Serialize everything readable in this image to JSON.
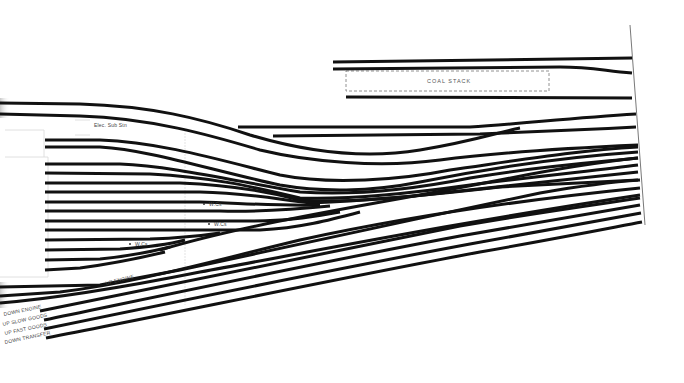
{
  "diagram": {
    "colors": {
      "track": "#111111",
      "label": "#444444",
      "background": "#ffffff"
    },
    "labels": {
      "coal_stack": "COAL STACK",
      "elec_sub_stn": "Elec. Sub Stn",
      "wc_1": "W.Cs",
      "wc_2": "W.Cs",
      "wc_3": "W.Cs",
      "up_engine": "UP ENGINE",
      "down_engine": "DOWN ENGINE",
      "up_slow_goods": "UP SLOW GOODS",
      "up_fast_goods": "UP FAST GOODS",
      "down_transfer": "DOWN TRANSFER"
    },
    "tracks": [
      {
        "id": "coal-top",
        "d": "M333,62 L632,58"
      },
      {
        "id": "coal-mid",
        "d": "M333,69 L560,67 C590,67 600,70 632,73"
      },
      {
        "id": "coal-bottom",
        "d": "M346,97 L632,98"
      },
      {
        "id": "upper-long",
        "d": "M238,127 L470,127 C520,124 570,118 636,114"
      },
      {
        "id": "upper-short",
        "d": "M273,136 L480,134 C520,132 580,130 636,127"
      },
      {
        "id": "main-1",
        "d": "M0,103 L80,104 C150,106 200,118 250,135 C300,150 360,160 420,150 C470,142 500,132 520,128"
      },
      {
        "id": "main-2",
        "d": "M0,114 L80,116 C150,118 210,135 260,150 C310,162 380,168 440,160 C500,152 570,148 638,145"
      },
      {
        "id": "siding-1",
        "d": "M45,140 L100,140 C160,142 220,160 280,175 C330,185 400,180 450,170 C520,160 580,150 638,147"
      },
      {
        "id": "siding-2",
        "d": "M45,147 L100,147 C150,150 210,170 280,185 C320,192 370,192 420,182 C500,166 580,156 638,152"
      },
      {
        "id": "siding-3",
        "d": "M45,164 L120,164 C170,166 230,180 300,192 C360,196 420,188 470,178 C540,166 600,162 638,158"
      },
      {
        "id": "siding-4",
        "d": "M45,173 L150,174 C210,177 250,186 300,198 C350,200 420,192 470,185 C540,176 600,170 638,165"
      },
      {
        "id": "siding-5",
        "d": "M45,183 L180,183 C230,185 270,192 300,200 C340,203 400,198 450,192 C530,183 590,177 638,172"
      },
      {
        "id": "siding-6",
        "d": "M45,192 L200,192 C250,193 280,200 310,203 C380,200 440,194 500,187 C560,184 600,182 638,180"
      },
      {
        "id": "siding-7",
        "d": "M45,202 L200,202 C240,203 270,206 320,205"
      },
      {
        "id": "siding-8",
        "d": "M45,211 L220,211 C260,212 290,210 330,206"
      },
      {
        "id": "siding-9",
        "d": "M45,221 L250,221 C290,221 310,217 340,212"
      },
      {
        "id": "siding-10",
        "d": "M45,230 L260,230 C300,228 330,220 360,212"
      },
      {
        "id": "siding-11",
        "d": "M45,240 L150,239 C180,238 200,236 220,233"
      },
      {
        "id": "siding-12",
        "d": "M45,250 L120,249 C150,247 170,244 185,240"
      },
      {
        "id": "siding-13",
        "d": "M45,260 L100,259 C130,256 150,252 170,247"
      },
      {
        "id": "siding-14",
        "d": "M45,270 L80,268 C110,264 140,258 165,252"
      },
      {
        "id": "diag-1",
        "d": "M160,250 C260,220 400,200 500,180 C560,168 600,162 638,158"
      },
      {
        "id": "diag-2",
        "d": "M0,287 L100,285 L180,270 C280,248 420,218 540,193 C580,186 610,182 640,180"
      },
      {
        "id": "diag-3",
        "d": "M0,296 L60,292 C140,282 200,264 300,240 C420,214 540,198 640,188"
      },
      {
        "id": "diag-4",
        "d": "M0,303 C60,298 120,288 200,272 C320,250 460,222 640,195"
      },
      {
        "id": "down-engine",
        "d": "M40,311 C150,290 300,258 460,226 C540,212 600,204 640,198"
      },
      {
        "id": "up-slow-goods",
        "d": "M44,320 C160,296 320,262 460,236 C540,222 600,212 640,205"
      },
      {
        "id": "up-fast-goods",
        "d": "M44,329 C160,305 330,270 470,244 C550,230 605,220 641,213"
      },
      {
        "id": "down-transfer",
        "d": "M46,338 C170,314 340,278 480,252 C560,238 610,228 642,222"
      }
    ]
  }
}
